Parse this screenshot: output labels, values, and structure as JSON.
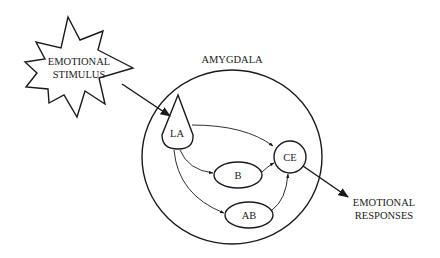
{
  "diagram": {
    "stimulus": {
      "line1": "EMOTIONAL",
      "line2": "STIMULUS",
      "shape": "starburst"
    },
    "region": {
      "label": "AMYGDALA",
      "shape": "circle"
    },
    "nodes": {
      "la": {
        "label": "LA",
        "shape": "cone"
      },
      "b": {
        "label": "B",
        "shape": "ellipse"
      },
      "ab": {
        "label": "AB",
        "shape": "ellipse"
      },
      "ce": {
        "label": "CE",
        "shape": "circle"
      }
    },
    "output": {
      "line1": "EMOTIONAL",
      "line2": "RESPONSES"
    },
    "edges": [
      {
        "from": "EMOTIONAL STIMULUS",
        "to": "LA"
      },
      {
        "from": "LA",
        "to": "CE"
      },
      {
        "from": "LA",
        "to": "B"
      },
      {
        "from": "LA",
        "to": "AB"
      },
      {
        "from": "B",
        "to": "CE"
      },
      {
        "from": "AB",
        "to": "CE"
      },
      {
        "from": "CE",
        "to": "EMOTIONAL RESPONSES"
      }
    ],
    "colors": {
      "line": "#1a1a1a",
      "text": "#222222",
      "background": "#ffffff"
    }
  }
}
